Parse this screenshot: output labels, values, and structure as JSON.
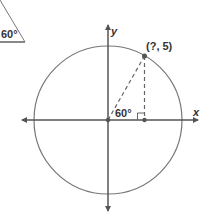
{
  "reference_triangle": {
    "angle_label": "60°"
  },
  "axes": {
    "x_label": "x",
    "y_label": "y"
  },
  "point": {
    "label": "(?, 5)"
  },
  "angle": {
    "label": "60°"
  },
  "colors": {
    "stroke": "#555555",
    "circle": "#777777",
    "text": "#333333"
  }
}
